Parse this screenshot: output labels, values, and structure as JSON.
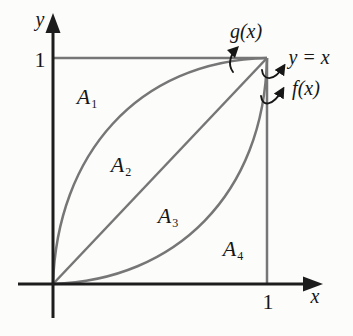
{
  "colors": {
    "bg": "#fcfcfb",
    "curve": "#767676",
    "axis": "#1c1c1c",
    "ink": "#161616"
  },
  "axes": {
    "x_label": "x",
    "y_label": "y",
    "x_tick": "1",
    "y_tick": "1"
  },
  "curve_labels": {
    "g": "g(x)",
    "identity": "y = x",
    "f": "f(x)"
  },
  "regions": [
    {
      "base": "A",
      "sub": "1"
    },
    {
      "base": "A",
      "sub": "2"
    },
    {
      "base": "A",
      "sub": "3"
    },
    {
      "base": "A",
      "sub": "4"
    }
  ],
  "icons": {
    "axis_arrowhead": "filled-triangle",
    "label_arrow": "curved-pointer-arrow"
  }
}
